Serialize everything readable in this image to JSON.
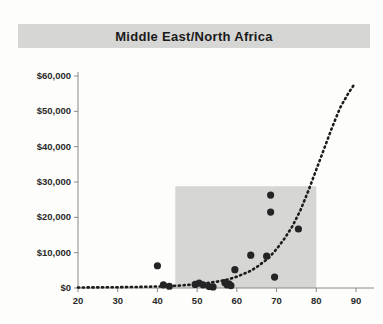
{
  "title": "Middle East/North Africa",
  "colors": {
    "banner": "#d6d6d4",
    "highlight_rect": "#cfcfcd",
    "axis": "#8a8a88",
    "point": "#242424",
    "trend": "#1c1c1c",
    "background": "#fdfdfb",
    "text": "#1a1a1a"
  },
  "chart_data": {
    "type": "scatter",
    "title": "Middle East/North Africa",
    "xlabel": "",
    "ylabel": "",
    "xlim": [
      20,
      90
    ],
    "ylim": [
      0,
      60000
    ],
    "xticks": [
      20,
      30,
      40,
      50,
      60,
      70,
      80,
      90
    ],
    "xtick_labels": [
      "20",
      "30",
      "40",
      "50",
      "60",
      "70",
      "80",
      "90"
    ],
    "yticks": [
      0,
      10000,
      20000,
      30000,
      40000,
      50000,
      60000
    ],
    "ytick_labels": [
      "$0",
      "$10,000",
      "$20,000",
      "$30,000",
      "$40,000",
      "$50,000",
      "$60,000"
    ],
    "grid": false,
    "legend": "none",
    "points": [
      {
        "x": 40.0,
        "y": 6300
      },
      {
        "x": 41.5,
        "y": 900
      },
      {
        "x": 43.0,
        "y": 500
      },
      {
        "x": 49.5,
        "y": 1000
      },
      {
        "x": 50.5,
        "y": 1400
      },
      {
        "x": 51.5,
        "y": 900
      },
      {
        "x": 53.0,
        "y": 400
      },
      {
        "x": 54.0,
        "y": 300
      },
      {
        "x": 57.0,
        "y": 1500
      },
      {
        "x": 57.5,
        "y": 900
      },
      {
        "x": 58.0,
        "y": 1200
      },
      {
        "x": 58.5,
        "y": 700
      },
      {
        "x": 59.5,
        "y": 5200
      },
      {
        "x": 63.5,
        "y": 9300
      },
      {
        "x": 67.5,
        "y": 9000
      },
      {
        "x": 68.5,
        "y": 26300
      },
      {
        "x": 68.5,
        "y": 21500
      },
      {
        "x": 69.5,
        "y": 3100
      },
      {
        "x": 75.5,
        "y": 16700
      }
    ],
    "trend": {
      "type": "exponential",
      "label": "fitted curve",
      "style": "dotted",
      "points": [
        {
          "x": 20,
          "y": 150
        },
        {
          "x": 25,
          "y": 180
        },
        {
          "x": 30,
          "y": 230
        },
        {
          "x": 35,
          "y": 300
        },
        {
          "x": 40,
          "y": 420
        },
        {
          "x": 45,
          "y": 650
        },
        {
          "x": 50,
          "y": 1050
        },
        {
          "x": 55,
          "y": 1800
        },
        {
          "x": 58,
          "y": 2500
        },
        {
          "x": 60,
          "y": 3200
        },
        {
          "x": 63,
          "y": 4600
        },
        {
          "x": 65,
          "y": 5900
        },
        {
          "x": 68,
          "y": 8500
        },
        {
          "x": 70,
          "y": 11000
        },
        {
          "x": 72,
          "y": 14000
        },
        {
          "x": 74,
          "y": 17500
        },
        {
          "x": 76,
          "y": 22000
        },
        {
          "x": 78,
          "y": 27500
        },
        {
          "x": 80,
          "y": 33500
        },
        {
          "x": 82,
          "y": 39500
        },
        {
          "x": 84,
          "y": 45500
        },
        {
          "x": 86,
          "y": 51000
        },
        {
          "x": 88,
          "y": 55000
        },
        {
          "x": 89.5,
          "y": 57500
        }
      ]
    },
    "highlight_rect": {
      "x0": 44.5,
      "x1": 80.0,
      "y0": 0,
      "y1": 28800
    }
  }
}
